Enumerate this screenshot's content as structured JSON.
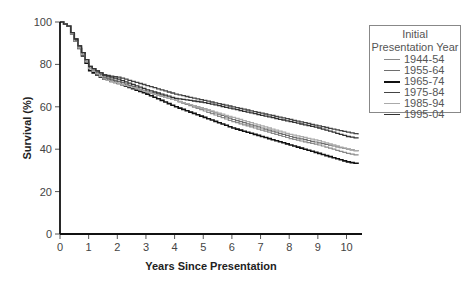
{
  "chart_data": {
    "type": "line",
    "title": "",
    "xlabel": "Years Since Presentation",
    "ylabel": "Survival (%)",
    "xlim": [
      0,
      10.5
    ],
    "ylim": [
      0,
      100
    ],
    "xticks": [
      0,
      1,
      2,
      3,
      4,
      5,
      6,
      7,
      8,
      9,
      10
    ],
    "yticks": [
      0,
      20,
      40,
      60,
      80,
      100
    ],
    "grid": false,
    "legend_position": "upper right (outside)",
    "legend_title": "Initial Presentation Year",
    "x": [
      0,
      0.25,
      0.5,
      1,
      1.5,
      2,
      3,
      4,
      5,
      6,
      7,
      8,
      9,
      10,
      10.4
    ],
    "series": [
      {
        "name": "1944-54",
        "color": "#8a8a8a",
        "width": 1.2,
        "values": [
          100,
          98,
          92,
          79,
          74,
          72,
          67,
          63,
          58,
          53,
          49,
          45,
          42,
          38,
          37
        ]
      },
      {
        "name": "1955-64",
        "color": "#6e6e6e",
        "width": 1.2,
        "values": [
          100,
          98,
          91,
          78,
          74,
          72,
          67,
          63,
          59,
          54,
          50,
          46,
          43,
          40,
          39
        ]
      },
      {
        "name": "1965-74",
        "color": "#111111",
        "width": 1.6,
        "values": [
          100,
          98,
          91,
          77,
          73,
          71,
          66,
          60,
          55,
          50,
          46,
          42,
          38,
          34,
          33
        ]
      },
      {
        "name": "1975-84",
        "color": "#444444",
        "width": 1.3,
        "values": [
          100,
          98,
          92,
          79,
          75,
          74,
          70,
          66,
          63,
          60,
          57,
          54,
          51,
          48,
          47
        ]
      },
      {
        "name": "1985-94",
        "color": "#aaaaaa",
        "width": 1.3,
        "values": [
          100,
          98,
          91,
          78,
          73,
          71,
          67,
          63,
          59,
          55,
          51,
          47,
          44,
          40,
          39
        ]
      },
      {
        "name": "1995-04",
        "color": "#333333",
        "width": 1.3,
        "values": [
          100,
          98,
          92,
          79,
          75,
          73,
          68,
          64,
          62,
          59,
          56,
          53,
          50,
          46,
          45
        ]
      }
    ]
  },
  "legend": {
    "title_line1": "Initial",
    "title_line2": "Presentation Year",
    "items": [
      {
        "label": "1944-54",
        "color": "#8a8a8a"
      },
      {
        "label": "1955-64",
        "color": "#6e6e6e"
      },
      {
        "label": "1965-74",
        "color": "#111111"
      },
      {
        "label": "1975-84",
        "color": "#444444"
      },
      {
        "label": "1985-94",
        "color": "#aaaaaa"
      },
      {
        "label": "1995-04",
        "color": "#333333"
      }
    ]
  },
  "axes": {
    "xlabel": "Years Since Presentation",
    "ylabel": "Survival (%)"
  }
}
